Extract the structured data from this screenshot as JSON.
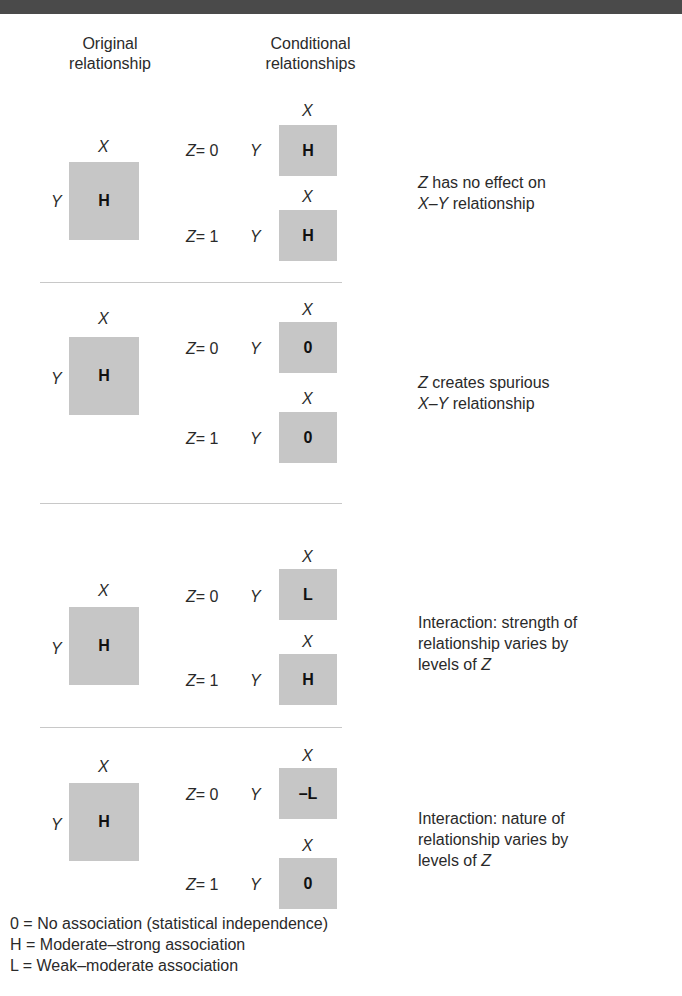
{
  "headers": {
    "original": [
      "Original",
      "relationship"
    ],
    "conditional": [
      "Conditional",
      "relationships"
    ]
  },
  "axis_labels": {
    "x": "X",
    "y": "Y",
    "z": "Z"
  },
  "z_levels": [
    "= 0",
    "= 1"
  ],
  "panels": [
    {
      "original": "H",
      "conditional": [
        "H",
        "H"
      ],
      "description_parts": [
        {
          "text": "Z",
          "italic": true
        },
        {
          "text": " has no effect on\n",
          "italic": false
        },
        {
          "text": "X–Y",
          "italic": true
        },
        {
          "text": " relationship",
          "italic": false
        }
      ]
    },
    {
      "original": "H",
      "conditional": [
        "0",
        "0"
      ],
      "description_parts": [
        {
          "text": "Z",
          "italic": true
        },
        {
          "text": "  creates spurious\n",
          "italic": false
        },
        {
          "text": "X–Y",
          "italic": true
        },
        {
          "text": " relationship",
          "italic": false
        }
      ]
    },
    {
      "original": "H",
      "conditional": [
        "L",
        "H"
      ],
      "description_parts": [
        {
          "text": "Interaction: strength of\nrelationship varies by\nlevels of ",
          "italic": false
        },
        {
          "text": "Z",
          "italic": true
        }
      ]
    },
    {
      "original": "H",
      "conditional": [
        "–L",
        "0"
      ],
      "description_parts": [
        {
          "text": "Interaction: nature of\nrelationship varies by\nlevels of ",
          "italic": false
        },
        {
          "text": "Z",
          "italic": true
        }
      ]
    }
  ],
  "legend": [
    {
      "symbol": "0",
      "meaning": "No association (statistical independence)"
    },
    {
      "symbol": "H",
      "meaning": "Moderate–strong association"
    },
    {
      "symbol": "L",
      "meaning": "Weak–moderate association"
    }
  ],
  "colors": {
    "box_fill": "#c6c6c6",
    "top_band": "#4a4a4a",
    "separator": "#c8c8c8",
    "text": "#2a2a2a"
  }
}
